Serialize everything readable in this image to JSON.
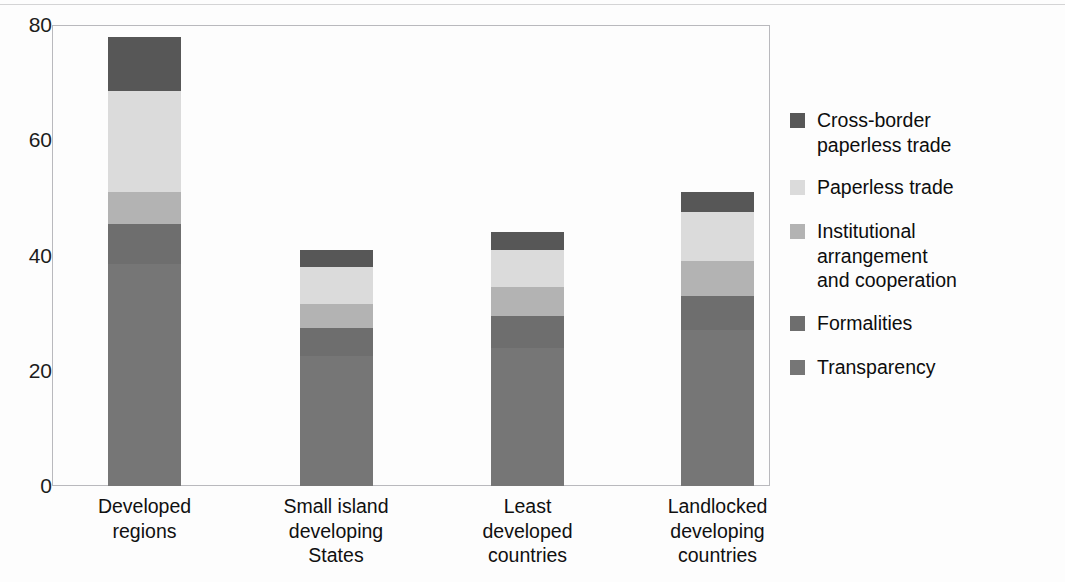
{
  "chart_data": {
    "type": "bar",
    "subtype": "stacked-bar",
    "title": "",
    "xlabel": "",
    "ylabel": "",
    "ylim": [
      0,
      80
    ],
    "yticks": [
      "0",
      "20",
      "40",
      "60",
      "80"
    ],
    "ytick_values": [
      0,
      20,
      40,
      60,
      80
    ],
    "grid": false,
    "legend_position": "right",
    "categories": [
      "Developed\nregions",
      "Small island\ndeveloping\nStates",
      "Least\ndeveloped\ncountries",
      "Landlocked\ndeveloping\ncountries"
    ],
    "series": [
      {
        "name": "Transparency",
        "color": "#767676",
        "values": [
          38.5,
          22.5,
          24.0,
          27.0
        ]
      },
      {
        "name": "Formalities",
        "color": "#6e6e6e",
        "values": [
          7.0,
          5.0,
          5.5,
          6.0
        ]
      },
      {
        "name": "Institutional arrangement and cooperation",
        "color": "#b3b3b3",
        "values": [
          5.5,
          4.0,
          5.0,
          6.0
        ]
      },
      {
        "name": "Paperless trade",
        "color": "#dbdbdb",
        "values": [
          17.5,
          6.5,
          6.5,
          8.5
        ]
      },
      {
        "name": "Cross-border paperless trade",
        "color": "#575757",
        "values": [
          9.5,
          3.0,
          3.0,
          3.5
        ]
      }
    ],
    "totals": [
      78.0,
      41.0,
      44.0,
      51.0
    ]
  },
  "legend": {
    "items": [
      {
        "label": "Cross-border\npaperless trade"
      },
      {
        "label": "Paperless trade"
      },
      {
        "label": "Institutional\narrangement\nand cooperation"
      },
      {
        "label": "Formalities"
      },
      {
        "label": "Transparency"
      }
    ]
  },
  "bleed_text": {
    "left": "                                                                                                                                                                                                                   ",
    "right": "",
    "bottom": ""
  }
}
